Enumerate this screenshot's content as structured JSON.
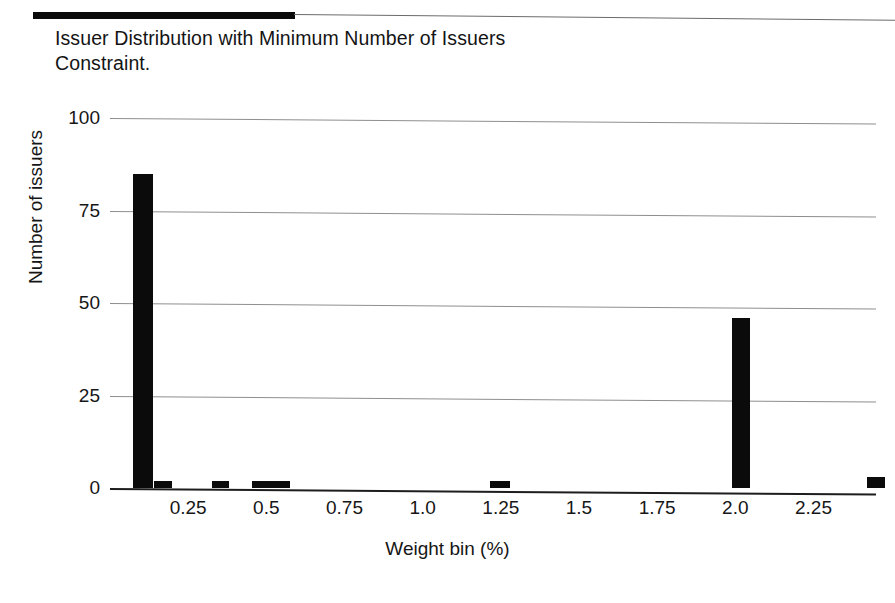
{
  "document": {
    "title_text": "Issuer Distribution with Minimum Number of Issuers\nConstraint.",
    "rule_color": "#0a0a0a"
  },
  "chart_data": {
    "type": "bar",
    "title": "Issuer Distribution with Minimum Number of Issuers Constraint.",
    "xlabel": "Weight bin (%)",
    "ylabel": "Number of issuers",
    "xlim": [
      0.0,
      2.45
    ],
    "ylim": [
      0,
      100
    ],
    "grid": true,
    "legend": null,
    "bar_color": "#0b0b0b",
    "x_tick_labels": [
      "0.25",
      "0.5",
      "0.75",
      "1.0",
      "1.25",
      "1.5",
      "1.75",
      "2.0",
      "2.25"
    ],
    "x_tick_values": [
      0.25,
      0.5,
      0.75,
      1.0,
      1.25,
      1.5,
      1.75,
      2.0,
      2.25
    ],
    "y_tick_labels": [
      "0",
      "25",
      "50",
      "75",
      "100"
    ],
    "y_tick_values": [
      0,
      25,
      50,
      75,
      100
    ],
    "bins": [
      {
        "x": 0.075,
        "width": 0.063,
        "value": 85
      },
      {
        "x": 0.14,
        "width": 0.058,
        "value": 2
      },
      {
        "x": 0.325,
        "width": 0.055,
        "value": 2
      },
      {
        "x": 0.455,
        "width": 0.12,
        "value": 2
      },
      {
        "x": 1.215,
        "width": 0.063,
        "value": 2
      },
      {
        "x": 1.99,
        "width": 0.058,
        "value": 46
      },
      {
        "x": 2.42,
        "width": 0.058,
        "value": 3
      }
    ]
  }
}
